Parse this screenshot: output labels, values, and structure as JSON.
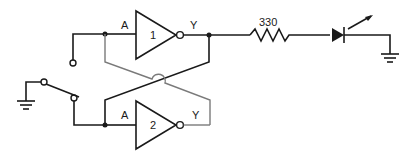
{
  "diagram": {
    "type": "circuit-schematic",
    "gates": [
      {
        "id": "gate-1",
        "number": "1",
        "input_label": "A",
        "output_label": "Y"
      },
      {
        "id": "gate-2",
        "number": "2",
        "input_label": "A",
        "output_label": "Y"
      }
    ],
    "resistor": {
      "label": "330"
    },
    "components": [
      "spdt-switch",
      "ground",
      "inverter-1",
      "inverter-2",
      "resistor",
      "led",
      "ground"
    ],
    "colors": {
      "line": "#1a1a1a",
      "feedback_line": "#7a7a7a",
      "background": "#ffffff"
    }
  }
}
